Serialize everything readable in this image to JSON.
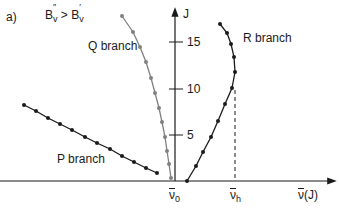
{
  "panel_label": "a)",
  "condition": {
    "lhs": "B",
    "lhs_sup": "″",
    "lhs_sub": "v",
    "op": ">",
    "rhs": "B",
    "rhs_sup": "′",
    "rhs_sub": "v"
  },
  "axes": {
    "y_label": "J",
    "y_ticks": [
      "5",
      "10",
      "15"
    ],
    "x_label_base": "ν",
    "x_label_suffix": "(J)",
    "x_marks": [
      {
        "base": "ν",
        "sub": "0"
      },
      {
        "base": "ν",
        "sub": "h"
      }
    ]
  },
  "branches": {
    "p": {
      "label": "P branch",
      "color": "#1a1a1a"
    },
    "q": {
      "label": "Q branch",
      "color": "#808080"
    },
    "r": {
      "label": "R branch",
      "color": "#1a1a1a"
    }
  },
  "chart_data": {
    "type": "scatter",
    "xlabel": "ν(J)",
    "ylabel": "J",
    "yticks": [
      5,
      10,
      15
    ],
    "xticks": [
      "ν0",
      "νh"
    ],
    "series": [
      {
        "name": "P branch",
        "points": [
          [
            24,
            105
          ],
          [
            36,
            111
          ],
          [
            48,
            118
          ],
          [
            60,
            124
          ],
          [
            72,
            130
          ],
          [
            85,
            137
          ],
          [
            97,
            143
          ],
          [
            110,
            149
          ],
          [
            122,
            156
          ],
          [
            134,
            162
          ],
          [
            146,
            168
          ],
          [
            157,
            173
          ]
        ]
      },
      {
        "name": "Q branch",
        "points": [
          [
            122,
            16
          ],
          [
            133,
            32
          ],
          [
            140,
            47
          ],
          [
            146,
            62
          ],
          [
            151,
            78
          ],
          [
            155,
            93
          ],
          [
            159,
            108
          ],
          [
            162,
            122
          ],
          [
            165,
            137
          ],
          [
            167,
            151
          ],
          [
            169,
            164
          ],
          [
            171,
            178
          ]
        ]
      },
      {
        "name": "R branch",
        "points": [
          [
            187,
            181
          ],
          [
            196,
            166
          ],
          [
            203,
            152
          ],
          [
            211,
            137
          ],
          [
            218,
            121
          ],
          [
            225,
            104
          ],
          [
            232,
            88
          ],
          [
            235,
            72
          ],
          [
            234,
            57
          ],
          [
            231,
            44
          ],
          [
            227,
            33
          ],
          [
            220,
            24
          ]
        ]
      }
    ]
  }
}
